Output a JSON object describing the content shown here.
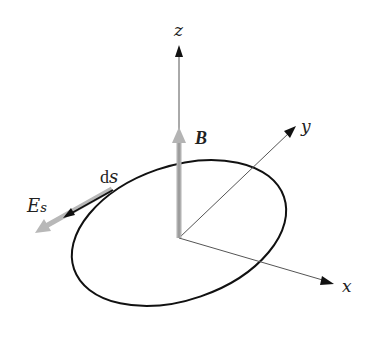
{
  "diagram": {
    "type": "3d-axes-loop",
    "axes": {
      "x": {
        "label": "x"
      },
      "y": {
        "label": "y"
      },
      "z": {
        "label": "z"
      }
    },
    "vectors": {
      "magnetic_field": {
        "label": "B",
        "color": "#a8a8a8",
        "direction": "+z"
      },
      "path_element": {
        "label_prefix": "d",
        "label_var": "s",
        "color": "#111111"
      },
      "electric_field": {
        "label_main": "E",
        "label_sub": "s",
        "color": "#b0b0b0"
      }
    },
    "loop": {
      "shape": "ellipse (projected circle)",
      "stroke": "#111111"
    }
  }
}
